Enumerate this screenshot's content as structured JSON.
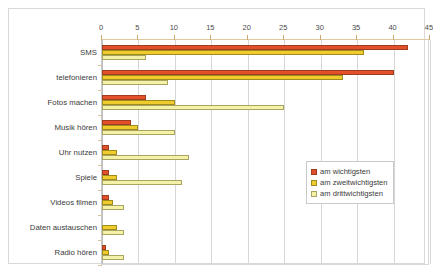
{
  "chart_data": {
    "type": "bar",
    "orientation": "horizontal",
    "title": "",
    "subtitle": "",
    "xlabel": "",
    "ylabel": "",
    "xlim": [
      0,
      45
    ],
    "xticks": [
      0,
      5,
      10,
      15,
      20,
      25,
      30,
      35,
      40,
      45
    ],
    "xtick_labels": [
      "0",
      "5",
      "10",
      "15",
      "20",
      "25",
      "30",
      "35",
      "40",
      "45"
    ],
    "grid": true,
    "grid_axis": "x",
    "axis_position": "top",
    "legend_position": "right-inside-lower",
    "categories": [
      "SMS",
      "telefonieren",
      "Fotos machen",
      "Musik hören",
      "Uhr nutzen",
      "Spiele",
      "Videos filmen",
      "Daten austauschen",
      "Radio hören"
    ],
    "series": [
      {
        "name": "am wichtigsten",
        "color": "#E2502A",
        "border": "#9E3D1F",
        "values": [
          42,
          40,
          6,
          4,
          1,
          1,
          1,
          0,
          0.5
        ]
      },
      {
        "name": "am zweitwichtigsten",
        "color": "#EFCB2E",
        "border": "#A08C1D",
        "values": [
          36,
          33,
          10,
          5,
          2,
          2,
          1.5,
          2,
          1
        ]
      },
      {
        "name": "am drittwichtigsten",
        "color": "#F5F2A8",
        "border": "#A8A562",
        "values": [
          6,
          9,
          25,
          10,
          12,
          11,
          3,
          3,
          3
        ]
      }
    ]
  },
  "legend": {
    "items": [
      {
        "label": "am wichtigsten",
        "color": "#E2502A",
        "border": "#9E3D1F"
      },
      {
        "label": "am zweitwichtigsten",
        "color": "#EFCB2E",
        "border": "#A08C1D"
      },
      {
        "label": "am drittwichtigsten",
        "color": "#F5F2A8",
        "border": "#A8A562"
      }
    ]
  },
  "colors": {
    "series_1": "#E2502A",
    "series_2": "#EFCB2E",
    "series_3": "#F5F2A8",
    "gridline": "#D6D6D6",
    "frame": "#D9D9D9",
    "axis": "#E0C9A0",
    "text": "#3B3B3B"
  }
}
